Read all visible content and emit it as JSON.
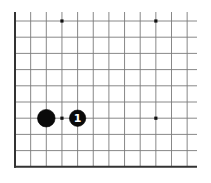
{
  "diagram": {
    "type": "go-board-fragment",
    "grid": {
      "columns": 12,
      "rows": 10,
      "open_edges": [
        "top",
        "right"
      ],
      "closed_edges": [
        "left",
        "bottom"
      ],
      "line_color": "#7a7a7a",
      "edge_color": "#333333"
    },
    "hoshi": [
      {
        "col": 3,
        "row": 0
      },
      {
        "col": 9,
        "row": 0
      },
      {
        "col": 3,
        "row": 6
      },
      {
        "col": 9,
        "row": 6
      }
    ],
    "stones": [
      {
        "color": "black",
        "col": 2,
        "row": 6,
        "label": ""
      },
      {
        "color": "black",
        "col": 4,
        "row": 6,
        "label": "1"
      }
    ]
  }
}
